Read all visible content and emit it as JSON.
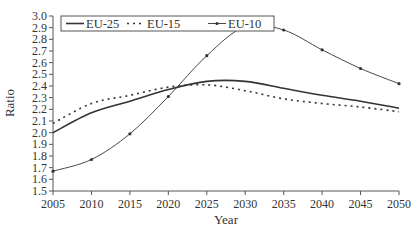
{
  "chart_data": {
    "type": "line",
    "title": "",
    "xlabel": "Year",
    "ylabel": "Ratio",
    "x": [
      2005,
      2010,
      2015,
      2020,
      2025,
      2030,
      2035,
      2040,
      2045,
      2050
    ],
    "xlim": [
      2005,
      2050
    ],
    "ylim": [
      1.5,
      3.0
    ],
    "x_ticks": [
      "2005",
      "2010",
      "2015",
      "2020",
      "2025",
      "2030",
      "2035",
      "2040",
      "2045",
      "2050"
    ],
    "y_ticks": [
      "1.5",
      "1.6",
      "1.7",
      "1.8",
      "1.9",
      "2.0",
      "2.1",
      "2.2",
      "2.3",
      "2.4",
      "2.5",
      "2.6",
      "2.7",
      "2.8",
      "2.9",
      "3.0"
    ],
    "grid": false,
    "legend_position": "top-left (inside, boxed)",
    "series": [
      {
        "name": "EU-25",
        "style": "solid",
        "values": [
          2.0,
          2.17,
          2.27,
          2.37,
          2.44,
          2.44,
          2.38,
          2.32,
          2.27,
          2.21
        ]
      },
      {
        "name": "EU-15",
        "style": "dotted",
        "values": [
          2.08,
          2.25,
          2.32,
          2.39,
          2.41,
          2.36,
          2.29,
          2.25,
          2.22,
          2.18
        ]
      },
      {
        "name": "EU-10",
        "style": "thin solid with point markers",
        "values": [
          1.67,
          1.77,
          1.99,
          2.31,
          2.66,
          2.91,
          2.88,
          2.71,
          2.55,
          2.42
        ]
      }
    ]
  },
  "colors": {
    "line": "#333333",
    "axis": "#555555",
    "background": "#ffffff"
  }
}
